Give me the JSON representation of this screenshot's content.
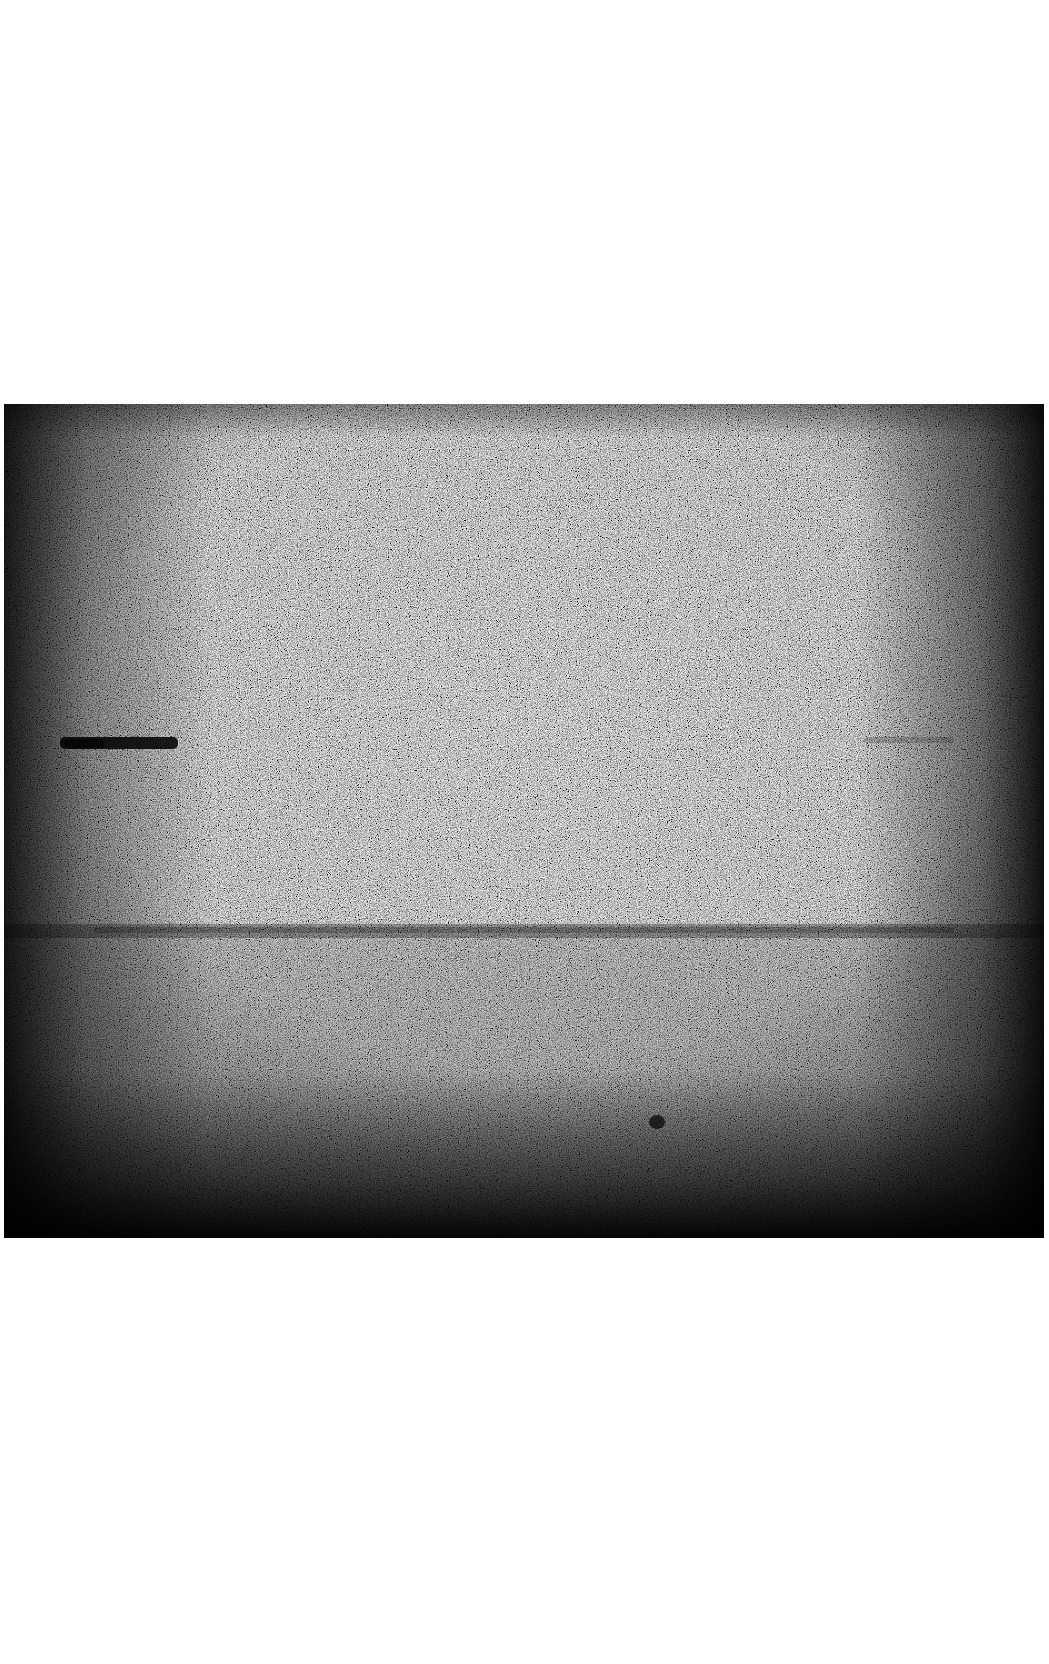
{
  "image": {
    "description": "Grainy low-light monochrome photograph of a flat horizon with a dark elongated object on the left and a small dark speck in the lower foreground",
    "frame": {
      "x": 4,
      "y": 404,
      "width": 1040,
      "height": 834
    },
    "colors": {
      "page_background": "#ffffff",
      "mid_gray": "#8a8a8a",
      "dark": "#050505",
      "light": "#e8e8e8"
    },
    "features": [
      {
        "name": "dark-elongated-object",
        "x": 56,
        "y": 332,
        "width": 120,
        "height": 14
      },
      {
        "name": "horizon-line",
        "y": 527
      },
      {
        "name": "small-dark-speck",
        "x": 648,
        "y": 712,
        "width": 16,
        "height": 14
      },
      {
        "name": "faint-streak-right",
        "x": 860,
        "y": 332,
        "width": 90,
        "height": 8
      }
    ]
  }
}
